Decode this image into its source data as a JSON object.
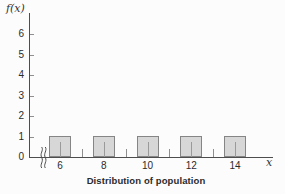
{
  "figure": {
    "caption": "Distribution of population"
  },
  "chart_data": {
    "type": "bar",
    "title": "Distribution of population",
    "xlabel": "x",
    "ylabel": "f(x)",
    "categories": [
      6,
      8,
      10,
      12,
      14
    ],
    "values": [
      1,
      1,
      1,
      1,
      1
    ],
    "bar_width_in_x_units": 1,
    "ylim": [
      0,
      6
    ],
    "yticks": [
      0,
      1,
      2,
      3,
      4,
      5,
      6
    ],
    "xticks_labeled": [
      6,
      8,
      10,
      12,
      14
    ],
    "xticks_minor": [
      7,
      9,
      11,
      13
    ],
    "x_axis_break_before_first_bar": true,
    "grid": false,
    "legend": "none",
    "colors": {
      "background": "#fcfcfc",
      "axis": "#4d4d4d",
      "bar_fill": "#d7d7d7",
      "bar_border": "#858585",
      "tick": "#8f8f8f",
      "in_bar_tick": "#9a9a9a",
      "text": "#2b2b2b"
    }
  }
}
